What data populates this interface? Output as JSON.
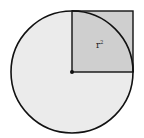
{
  "diagram": {
    "type": "geometry",
    "circle": {
      "cx": 72,
      "cy": 72,
      "r": 61,
      "fill": "#ebebeb",
      "stroke": "#111111"
    },
    "square": {
      "x": 72,
      "y": 11,
      "size": 61,
      "fill": "#cfcfcf",
      "stroke": "#111111"
    },
    "center_point": {
      "x": 72,
      "y": 72
    },
    "square_label": {
      "base": "r",
      "exponent": "2"
    }
  }
}
